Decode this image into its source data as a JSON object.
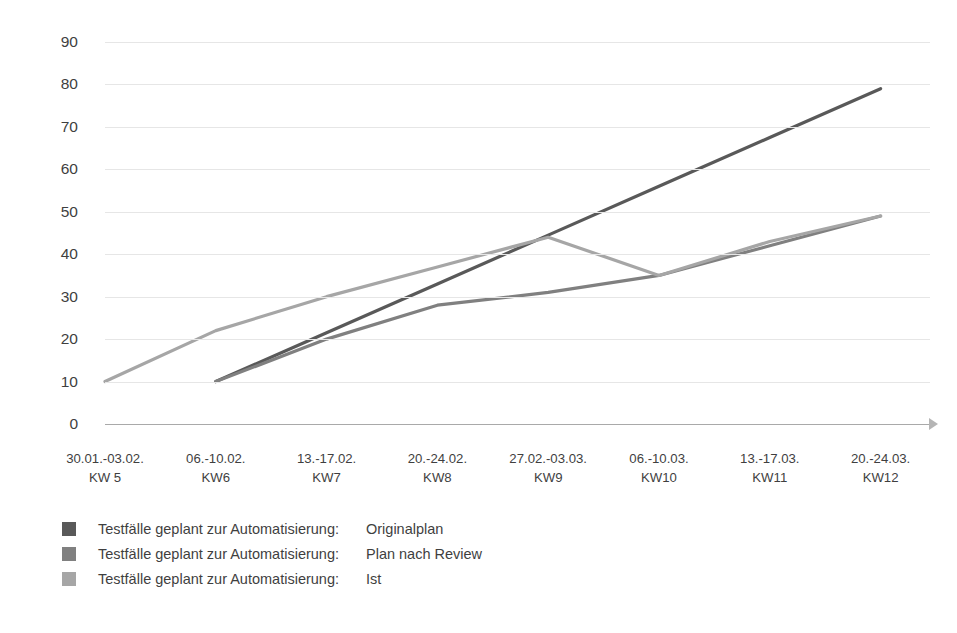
{
  "chart_data": {
    "type": "line",
    "title": "",
    "xlabel": "",
    "ylabel": "",
    "ylim": [
      0,
      90
    ],
    "ytick_step": 10,
    "grid": true,
    "legend_position": "bottom-left",
    "yticks": [
      "90",
      "80",
      "70",
      "60",
      "50",
      "40",
      "30",
      "20",
      "10",
      "0"
    ],
    "categories": [
      {
        "date": "30.01.-03.02.",
        "week": "KW 5"
      },
      {
        "date": "06.-10.02.",
        "week": "KW6"
      },
      {
        "date": "13.-17.02.",
        "week": "KW7"
      },
      {
        "date": "20.-24.02.",
        "week": "KW8"
      },
      {
        "date": "27.02.-03.03.",
        "week": "KW9"
      },
      {
        "date": "06.-10.03.",
        "week": "KW10"
      },
      {
        "date": "13.-17.03.",
        "week": "KW11"
      },
      {
        "date": "20.-24.03.",
        "week": "KW12"
      }
    ],
    "series": [
      {
        "name": "Testfälle geplant zur Automatisierung:",
        "variant": "Originalplan",
        "color": "#595959",
        "values": [
          null,
          10,
          21.5,
          33,
          44.5,
          56,
          67.5,
          79
        ]
      },
      {
        "name": "Testfälle geplant zur Automatisierung:",
        "variant": "Plan nach Review",
        "color": "#808080",
        "values": [
          null,
          10,
          20,
          28,
          31,
          35,
          42,
          49
        ]
      },
      {
        "name": "Testfälle geplant zur Automatisierung:",
        "variant": "Ist",
        "color": "#a6a6a6",
        "values": [
          10,
          22,
          30,
          37,
          44,
          35,
          43,
          49
        ]
      }
    ]
  },
  "legend": [
    {
      "name": "Testfälle geplant zur Automatisierung:",
      "variant": "Originalplan",
      "color": "#595959"
    },
    {
      "name": "Testfälle geplant zur Automatisierung:",
      "variant": "Plan nach Review",
      "color": "#808080"
    },
    {
      "name": "Testfälle geplant zur Automatisierung:",
      "variant": "Ist",
      "color": "#a6a6a6"
    }
  ],
  "axis": {
    "arrow_icon": "arrow-right-icon"
  }
}
